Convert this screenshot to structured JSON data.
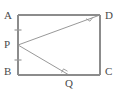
{
  "figure": {
    "kind": "plane-geometry-diagram",
    "background_color": "#ffffff",
    "line_color": "#8c8c8c",
    "label_color": "#4a4a4a",
    "rectangle": {
      "name": "ABCD",
      "corners": {
        "A": {
          "label": "A",
          "x": 18,
          "y": 15
        },
        "D": {
          "label": "D",
          "x": 100,
          "y": 15
        },
        "C": {
          "label": "C",
          "x": 100,
          "y": 75
        },
        "B": {
          "label": "B",
          "x": 18,
          "y": 75
        }
      }
    },
    "points": {
      "P": {
        "label": "P",
        "x": 18,
        "y": 45,
        "on_segment": "AB",
        "note": "midpoint"
      },
      "Q": {
        "label": "Q",
        "x": 69,
        "y": 75,
        "on_segment": "BC"
      }
    },
    "segments": [
      {
        "name": "PD",
        "from": "P",
        "to": "D"
      },
      {
        "name": "PQ",
        "from": "P",
        "to": "Q"
      }
    ],
    "marks": {
      "congruent_ticks": [
        {
          "on": "AP",
          "x": 18,
          "y": 30
        },
        {
          "on": "PB",
          "x": 18,
          "y": 60
        }
      ],
      "right_angles": [
        {
          "at": "D",
          "between": [
            "AD",
            "DP"
          ]
        },
        {
          "at": "Q",
          "between": [
            "BQ",
            "QP"
          ]
        }
      ]
    }
  }
}
